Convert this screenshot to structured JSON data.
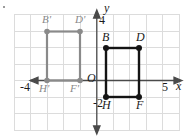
{
  "figure": {
    "kind": "coordinate-plane-transformation",
    "grid": {
      "visible": true,
      "color": "#d8d8d8",
      "spacing_units": 1,
      "x_range": [
        -5,
        5
      ],
      "y_range": [
        -3,
        4
      ]
    },
    "axes": {
      "color": "#3a3a3a",
      "x_label": "x",
      "y_label": "y",
      "origin_label": "O"
    },
    "tick_labels": [
      {
        "text": "4",
        "axis": "y",
        "value": 4
      },
      {
        "text": "-2",
        "axis": "y",
        "value": -2
      },
      {
        "text": "-4",
        "axis": "x",
        "value": -4
      },
      {
        "text": "5",
        "axis": "x",
        "value": 5
      }
    ],
    "shapes": [
      {
        "name": "preimage-rectangle",
        "color": "#141414",
        "vertices": [
          {
            "label": "B",
            "x": 0.5,
            "y": 2,
            "label_pos": "above"
          },
          {
            "label": "D",
            "x": 2.5,
            "y": 2,
            "label_pos": "above"
          },
          {
            "label": "F",
            "x": 2.5,
            "y": -1,
            "label_pos": "below"
          },
          {
            "label": "H",
            "x": 0.5,
            "y": -1,
            "label_pos": "below"
          }
        ]
      },
      {
        "name": "image-rectangle",
        "color": "#8a8a8a",
        "vertices": [
          {
            "label": "B'",
            "x": -3,
            "y": 3,
            "label_pos": "above"
          },
          {
            "label": "D'",
            "x": -1,
            "y": 3,
            "label_pos": "above"
          },
          {
            "label": "F'",
            "x": -1,
            "y": 0,
            "label_pos": "below"
          },
          {
            "label": "H'",
            "x": -3,
            "y": 0,
            "label_pos": "below"
          }
        ]
      }
    ],
    "marks": {
      "corner_dot": "."
    }
  }
}
